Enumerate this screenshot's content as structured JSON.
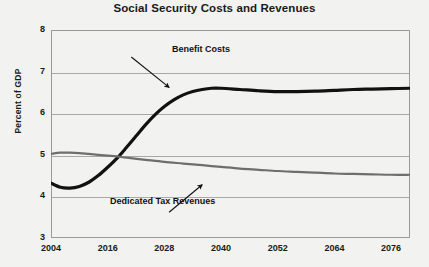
{
  "chart_data": {
    "type": "line",
    "title": "Social Security Costs and Revenues",
    "xlabel": "",
    "ylabel": "Percent of GDP",
    "xlim": [
      2004,
      2080
    ],
    "ylim": [
      3,
      8
    ],
    "xticks": [
      2004,
      2016,
      2028,
      2040,
      2052,
      2064,
      2076
    ],
    "xtick_labels": [
      "2004",
      "2016",
      "2028",
      "2040",
      "2052",
      "2064",
      "2076"
    ],
    "yticks": [
      3,
      4,
      5,
      6,
      7,
      8
    ],
    "ytick_labels": [
      "3",
      "4",
      "5",
      "6",
      "7",
      "8"
    ],
    "grid": true,
    "legend": "none",
    "annotations": [
      {
        "id": "benefit-costs",
        "text": "Benefit Costs",
        "points_to_series": "Benefit Costs",
        "arrow_from": [
          2021,
          7.35
        ],
        "arrow_to": [
          2029,
          6.62
        ]
      },
      {
        "id": "dedicated-tax-revenues",
        "text": "Dedicated Tax Revenues",
        "points_to_series": "Dedicated Tax Revenues",
        "arrow_from": [
          2029,
          3.62
        ],
        "arrow_to": [
          2036,
          4.28
        ]
      }
    ],
    "series": [
      {
        "name": "Benefit Costs",
        "color": "#111111",
        "width": 3.2,
        "x": [
          2004,
          2006,
          2008,
          2010,
          2012,
          2014,
          2016,
          2018,
          2020,
          2022,
          2024,
          2026,
          2028,
          2030,
          2032,
          2034,
          2036,
          2038,
          2040,
          2044,
          2048,
          2052,
          2056,
          2060,
          2064,
          2068,
          2072,
          2076,
          2080
        ],
        "values": [
          4.32,
          4.22,
          4.2,
          4.24,
          4.34,
          4.5,
          4.7,
          4.92,
          5.18,
          5.45,
          5.72,
          5.96,
          6.16,
          6.32,
          6.44,
          6.52,
          6.57,
          6.6,
          6.6,
          6.57,
          6.54,
          6.52,
          6.52,
          6.53,
          6.55,
          6.57,
          6.58,
          6.59,
          6.6
        ]
      },
      {
        "name": "Dedicated Tax Revenues",
        "color": "#6e6e6e",
        "width": 2.2,
        "x": [
          2004,
          2006,
          2008,
          2010,
          2012,
          2014,
          2016,
          2018,
          2020,
          2024,
          2028,
          2032,
          2036,
          2040,
          2044,
          2048,
          2052,
          2056,
          2060,
          2064,
          2068,
          2072,
          2076,
          2080
        ],
        "values": [
          5.02,
          5.05,
          5.05,
          5.04,
          5.02,
          5.0,
          4.98,
          4.96,
          4.93,
          4.88,
          4.83,
          4.79,
          4.75,
          4.71,
          4.67,
          4.64,
          4.61,
          4.59,
          4.57,
          4.55,
          4.54,
          4.53,
          4.52,
          4.52
        ]
      }
    ]
  }
}
